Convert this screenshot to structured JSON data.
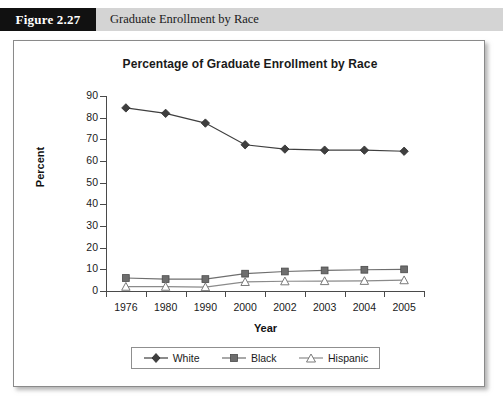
{
  "figure": {
    "number_label": "Figure 2.27",
    "caption": "Graduate Enrollment by Race"
  },
  "chart_data": {
    "type": "line",
    "title": "Percentage of Graduate Enrollment by Race",
    "xlabel": "Year",
    "ylabel": "Percent",
    "categories": [
      "1976",
      "1980",
      "1990",
      "2000",
      "2002",
      "2003",
      "2004",
      "2005"
    ],
    "ylim": [
      0,
      90
    ],
    "yticks": [
      "0",
      "10",
      "20",
      "30",
      "40",
      "50",
      "60",
      "70",
      "80",
      "90"
    ],
    "grid": false,
    "legend_position": "bottom",
    "series": [
      {
        "name": "White",
        "marker": "diamond-filled",
        "color": "#3f3f3f",
        "values": [
          84.5,
          82.0,
          77.5,
          67.5,
          65.5,
          65.0,
          65.0,
          64.5
        ]
      },
      {
        "name": "Black",
        "marker": "square-filled",
        "color": "#6e6e6e",
        "values": [
          6.0,
          5.5,
          5.5,
          8.0,
          9.0,
          9.5,
          9.8,
          10.0
        ]
      },
      {
        "name": "Hispanic",
        "marker": "triangle-open",
        "color": "#8a8a8a",
        "values": [
          2.0,
          2.0,
          1.8,
          4.2,
          4.5,
          4.6,
          4.7,
          5.0
        ]
      }
    ]
  }
}
